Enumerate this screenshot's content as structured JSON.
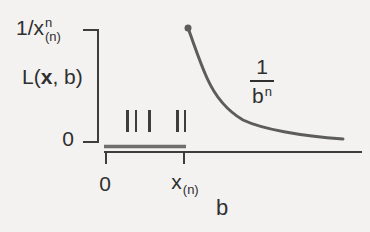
{
  "figure": {
    "background": "#f3f2f0",
    "ink": "#2f2f2f",
    "axis_color": "#3d3d3d",
    "curve_color": "#5c5c5c",
    "segment_color": "#6e6e6e"
  },
  "y_axis": {
    "top_label": {
      "base": "1/x",
      "sup": "n",
      "sub": "(n)"
    },
    "function_label": {
      "pre": "L(",
      "arg": "x",
      "post": ", b)"
    },
    "origin_label": "0"
  },
  "x_axis": {
    "origin_label": "0",
    "xn_label": {
      "base": "x",
      "sub": "(n)"
    },
    "axis_label": "b"
  },
  "curve_label": {
    "numerator": "1",
    "denominator_base": "b",
    "denominator_sup": "n"
  },
  "data_ticks": {
    "x_positions": [
      126,
      134.5,
      148,
      176,
      183.5
    ],
    "y_top": 110,
    "y_bottom": 132
  },
  "chart_data": {
    "type": "line",
    "xlabel": "b",
    "ylabel": "L(x, b)",
    "x_tick_labels": [
      "0",
      "x_(n)"
    ],
    "y_tick_labels": [
      "0",
      "1/x_(n)^n"
    ],
    "grid": false,
    "legend": "none",
    "annotations": [
      "1/b^n labels the decreasing curve"
    ],
    "series": [
      {
        "name": "L(x, b) = 0 for b < x_(n)",
        "style": "thick horizontal segment on the axis from b = 0 to b = x_(n)",
        "x_norm": [
          0.0,
          0.31
        ],
        "y_norm": [
          0.0,
          0.0
        ]
      },
      {
        "name": "L(x, b) = 1/b^n for b >= x_(n)",
        "style": "convex decreasing curve with filled dot at left end (x_(n), 1/x_(n)^n), asymptotic to 0",
        "x_norm": [
          0.32,
          0.35,
          0.41,
          0.47,
          0.55,
          0.64,
          0.75,
          0.88,
          1.0
        ],
        "y_norm": [
          1.0,
          0.83,
          0.56,
          0.39,
          0.23,
          0.13,
          0.07,
          0.04,
          0.03
        ]
      }
    ],
    "sample_marks": "5 short vertical ticks between 0 and x_(n) mark observed sample values; x_(n) is the sample maximum"
  }
}
